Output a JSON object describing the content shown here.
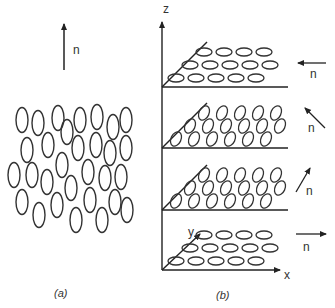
{
  "figure": {
    "panel_a": {
      "caption": "(a)",
      "director_label": "n",
      "description": "Nematic phase: elongated molecules randomly positioned, aligned along director n (vertical)",
      "molecules": [
        [
          22,
          120
        ],
        [
          38,
          123
        ],
        [
          58,
          118
        ],
        [
          67,
          132
        ],
        [
          80,
          120
        ],
        [
          97,
          117
        ],
        [
          113,
          127
        ],
        [
          126,
          120
        ],
        [
          27,
          150
        ],
        [
          48,
          145
        ],
        [
          78,
          148
        ],
        [
          96,
          145
        ],
        [
          110,
          153
        ],
        [
          126,
          148
        ],
        [
          14,
          175
        ],
        [
          32,
          175
        ],
        [
          47,
          182
        ],
        [
          62,
          165
        ],
        [
          71,
          188
        ],
        [
          88,
          172
        ],
        [
          105,
          178
        ],
        [
          121,
          177
        ],
        [
          22,
          202
        ],
        [
          39,
          215
        ],
        [
          57,
          205
        ],
        [
          76,
          220
        ],
        [
          90,
          200
        ],
        [
          102,
          220
        ],
        [
          115,
          202
        ],
        [
          127,
          210
        ]
      ]
    },
    "panel_b": {
      "caption": "(b)",
      "axis_labels": {
        "z": "z",
        "y": "y",
        "x": "x"
      },
      "description": "Twisted (cholesteric) structure: layers with director n rotating about z",
      "layers": [
        {
          "director_label": "n",
          "direction": "left"
        },
        {
          "director_label": "n",
          "direction": "up-left"
        },
        {
          "director_label": "n",
          "direction": "up-right"
        },
        {
          "director_label": "n",
          "direction": "right"
        }
      ]
    }
  }
}
